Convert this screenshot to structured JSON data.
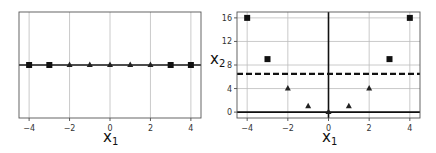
{
  "chart_data": [
    {
      "type": "scatter",
      "title": "",
      "xlabel": "x1",
      "ylabel": "",
      "xlim": [
        -4.5,
        4.5
      ],
      "ylim": [
        -0.2,
        0.2
      ],
      "grid": true,
      "xticks": [
        "-4",
        "-2",
        "0",
        "2",
        "4"
      ],
      "yticks": [],
      "series": [
        {
          "name": "class-square",
          "marker": "square",
          "x": [
            -4,
            -3,
            3,
            4
          ],
          "y": [
            0,
            0,
            0,
            0
          ]
        },
        {
          "name": "class-triangle",
          "marker": "triangle",
          "x": [
            -2,
            -1,
            0,
            1,
            2
          ],
          "y": [
            0,
            0,
            0,
            0,
            0
          ]
        }
      ],
      "lines": [
        {
          "orientation": "horizontal",
          "y": 0,
          "style": "solid"
        }
      ]
    },
    {
      "type": "scatter",
      "title": "",
      "xlabel": "x1",
      "ylabel": "x2",
      "xlim": [
        -4.5,
        4.5
      ],
      "ylim": [
        -1,
        17
      ],
      "grid": true,
      "xticks": [
        "-4",
        "-2",
        "0",
        "2",
        "4"
      ],
      "yticks": [
        "0",
        "4",
        "8",
        "12",
        "16"
      ],
      "series": [
        {
          "name": "class-square",
          "marker": "square",
          "x": [
            -4,
            -3,
            3,
            4
          ],
          "y": [
            16,
            9,
            9,
            16
          ]
        },
        {
          "name": "class-triangle",
          "marker": "triangle",
          "x": [
            -2,
            -1,
            0,
            1,
            2
          ],
          "y": [
            4,
            1,
            0,
            1,
            4
          ]
        }
      ],
      "lines": [
        {
          "orientation": "horizontal",
          "y": 0,
          "style": "solid"
        },
        {
          "orientation": "vertical",
          "x": 0,
          "style": "solid"
        },
        {
          "orientation": "horizontal",
          "y": 6.5,
          "style": "dashed"
        }
      ]
    }
  ],
  "labels": {
    "left_xlabel_main": "x",
    "left_xlabel_sub": "1",
    "right_xlabel_main": "x",
    "right_xlabel_sub": "1",
    "right_ylabel_main": "x",
    "right_ylabel_sub": "2"
  }
}
